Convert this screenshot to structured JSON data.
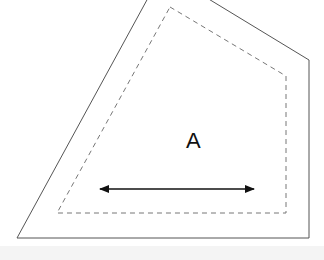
{
  "diagram": {
    "label": "A",
    "colors": {
      "outer_stroke": "#555555",
      "inner_stroke": "#777777",
      "arrow": "#111111",
      "label": "#111111",
      "background": "#ffffff",
      "bottom_band": "#f4f4f4"
    },
    "outer_polygon": [
      [
        148,
        -2
      ],
      [
        207,
        -2
      ],
      [
        309,
        60
      ],
      [
        309,
        238
      ],
      [
        17,
        238
      ]
    ],
    "inner_dashed_polygon": [
      [
        170,
        7
      ],
      [
        286,
        76
      ],
      [
        286,
        213
      ],
      [
        57,
        213
      ]
    ],
    "arrow": {
      "x1": 100,
      "x2": 254,
      "y": 189,
      "direction": "double-headed"
    }
  }
}
